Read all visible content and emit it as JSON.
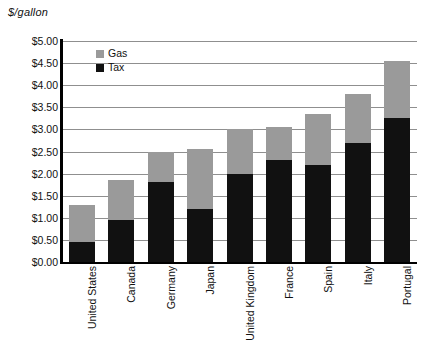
{
  "chart_data": {
    "type": "bar",
    "subtype": "stacked-vertical",
    "title": "",
    "xlabel": "",
    "ylabel": "$/gallon",
    "ylim": [
      0.0,
      5.0
    ],
    "ytick_step": 0.5,
    "grid": true,
    "legend_position": "top-left-inside",
    "categories": [
      "United States",
      "Canada",
      "Germany",
      "Japan",
      "United Kingdom",
      "France",
      "Spain",
      "Italy",
      "Portugal"
    ],
    "series": [
      {
        "name": "Tax",
        "color": "#111111",
        "values": [
          0.45,
          0.95,
          1.8,
          1.2,
          2.0,
          2.3,
          2.2,
          2.7,
          3.25
        ]
      },
      {
        "name": "Gas",
        "color": "#9a9a9a",
        "values": [
          0.85,
          0.9,
          0.7,
          1.35,
          1.0,
          0.75,
          1.15,
          1.1,
          1.3
        ]
      }
    ],
    "totals": [
      1.3,
      1.85,
      2.5,
      2.55,
      3.0,
      3.05,
      3.35,
      3.8,
      4.55
    ],
    "ytick_labels": [
      "$5.00",
      "$4.50",
      "$4.00",
      "$3.50",
      "$3.00",
      "$2.50",
      "$2.00",
      "$1.50",
      "$1.00",
      "$0.50",
      "$0.00"
    ],
    "ytick_values": [
      5.0,
      4.5,
      4.0,
      3.5,
      3.0,
      2.5,
      2.0,
      1.5,
      1.0,
      0.5,
      0.0
    ]
  },
  "legend": {
    "entries": [
      {
        "label": "Gas",
        "swatch": "gas"
      },
      {
        "label": "Tax",
        "swatch": "tax"
      }
    ]
  },
  "axis": {
    "unit_title": "$/gallon"
  }
}
